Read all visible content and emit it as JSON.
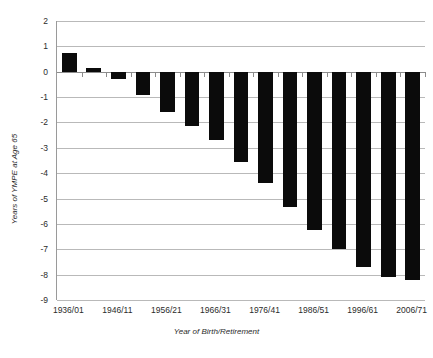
{
  "chart_data": {
    "type": "bar",
    "title": "",
    "xlabel": "Year of Birth/Retirement",
    "ylabel": "Years of YMPE at Age 65",
    "ylim": [
      -9,
      2
    ],
    "ytick_step": 1,
    "yticks": [
      "2",
      "1",
      "0",
      "-1",
      "-2",
      "-3",
      "-4",
      "-5",
      "-6",
      "-7",
      "-8",
      "-9"
    ],
    "grid": true,
    "legend": "none",
    "bar_color": "#0b0b0b",
    "gridline_color": "#b9b9b9",
    "axis_color": "#8c8c8c",
    "categories": [
      "1936/01",
      "1941/06",
      "1946/11",
      "1951/16",
      "1956/21",
      "1961/26",
      "1966/31",
      "1971/36",
      "1976/41",
      "1981/46",
      "1986/51",
      "1991/56",
      "1996/61",
      "2001/66",
      "2006/71"
    ],
    "xtick_labels": [
      "1936/01",
      "1946/11",
      "1956/21",
      "1966/31",
      "1976/41",
      "1986/51",
      "1996/61",
      "2006/71"
    ],
    "values": [
      0.75,
      0.15,
      -0.3,
      -0.9,
      -1.6,
      -2.15,
      -2.7,
      -3.55,
      -4.4,
      -5.35,
      -6.25,
      -7.0,
      -7.7,
      -8.1,
      -8.2
    ]
  }
}
